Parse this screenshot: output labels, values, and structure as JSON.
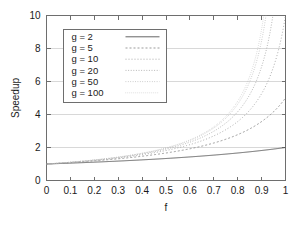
{
  "chart_data": {
    "type": "line",
    "title": "",
    "xlabel": "f",
    "ylabel": "Speedup",
    "xlim": [
      0,
      1
    ],
    "ylim": [
      0,
      10
    ],
    "grid": true,
    "legend_position": "upper-left-inside",
    "formula": "S(f) = 1 / ((1 - f) + f/g)",
    "xticks": [
      0,
      0.1,
      0.2,
      0.3,
      0.4,
      0.5,
      0.6,
      0.7,
      0.8,
      0.9,
      1
    ],
    "xtick_labels": [
      "0",
      "0.1",
      "0.2",
      "0.3",
      "0.4",
      "0.5",
      "0.6",
      "0.7",
      "0.8",
      "0.9",
      "1"
    ],
    "yticks": [
      0,
      2,
      4,
      6,
      8,
      10
    ],
    "ytick_labels": [
      "0",
      "2",
      "4",
      "6",
      "8",
      "10"
    ],
    "x": [
      0,
      0.05,
      0.1,
      0.15,
      0.2,
      0.25,
      0.3,
      0.35,
      0.4,
      0.45,
      0.5,
      0.55,
      0.6,
      0.65,
      0.7,
      0.75,
      0.8,
      0.85,
      0.9,
      0.95,
      1
    ],
    "series": [
      {
        "name": "g =   2",
        "g": 2,
        "color": "#555555",
        "dash": "none",
        "width": 0.9,
        "values": [
          1,
          1.026,
          1.053,
          1.081,
          1.111,
          1.143,
          1.176,
          1.212,
          1.25,
          1.29,
          1.333,
          1.379,
          1.429,
          1.481,
          1.538,
          1.6,
          1.667,
          1.739,
          1.818,
          1.905,
          2
        ]
      },
      {
        "name": "g =   5",
        "g": 5,
        "color": "#8a8a8a",
        "dash": "2,2",
        "width": 0.85,
        "values": [
          1,
          1.042,
          1.087,
          1.136,
          1.19,
          1.25,
          1.316,
          1.389,
          1.471,
          1.563,
          1.667,
          1.786,
          1.923,
          2.083,
          2.273,
          2.5,
          2.778,
          3.125,
          3.571,
          4.167,
          5
        ]
      },
      {
        "name": "g =  10",
        "g": 10,
        "color": "#9e9e9e",
        "dash": "1,2",
        "width": 0.85,
        "values": [
          1,
          1.047,
          1.099,
          1.156,
          1.22,
          1.29,
          1.37,
          1.46,
          1.563,
          1.681,
          1.818,
          1.98,
          2.174,
          2.41,
          2.703,
          3.077,
          3.571,
          4.255,
          5.263,
          6.897,
          10
        ]
      },
      {
        "name": "g =  20",
        "g": 20,
        "color": "#ababab",
        "dash": "1,1.6",
        "width": 0.85,
        "values": [
          1,
          1.05,
          1.105,
          1.166,
          1.235,
          1.311,
          1.399,
          1.498,
          1.613,
          1.747,
          1.905,
          2.094,
          2.326,
          2.614,
          2.985,
          3.478,
          4.167,
          5.195,
          6.897,
          10.256,
          20
        ]
      },
      {
        "name": "g =  50",
        "g": 50,
        "color": "#b8b8b8",
        "dash": "0.8,1.6",
        "width": 0.85,
        "values": [
          1,
          1.051,
          1.109,
          1.172,
          1.244,
          1.325,
          1.418,
          1.524,
          1.647,
          1.792,
          1.961,
          2.169,
          2.427,
          2.752,
          3.175,
          3.748,
          4.566,
          5.831,
          8.026,
          12.755,
          50
        ]
      },
      {
        "name": "g = 100",
        "g": 100,
        "color": "#c2c2c2",
        "dash": "0.6,1.4",
        "width": 0.85,
        "values": [
          1,
          1.052,
          1.11,
          1.174,
          1.247,
          1.33,
          1.425,
          1.534,
          1.661,
          1.81,
          1.985,
          2.202,
          2.475,
          2.817,
          3.268,
          3.883,
          4.785,
          6.211,
          8.772,
          14.706,
          100
        ]
      }
    ],
    "legend_entries": [
      {
        "label": "g =   2"
      },
      {
        "label": "g =   5"
      },
      {
        "label": "g =  10"
      },
      {
        "label": "g =  20"
      },
      {
        "label": "g =  50"
      },
      {
        "label": "g = 100"
      }
    ]
  }
}
